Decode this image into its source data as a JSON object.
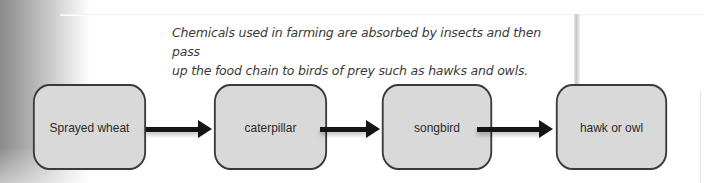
{
  "caption": {
    "line1": "Chemicals used in farming are absorbed by insects and then pass",
    "line2": "up the food chain to birds of prey such as hawks and owls."
  },
  "food_chain": {
    "nodes": [
      {
        "label": "Sprayed wheat"
      },
      {
        "label": "caterpillar"
      },
      {
        "label": "songbird"
      },
      {
        "label": "hawk or owl"
      }
    ],
    "edges": [
      {
        "from": "Sprayed wheat",
        "to": "caterpillar"
      },
      {
        "from": "caterpillar",
        "to": "songbird"
      },
      {
        "from": "songbird",
        "to": "hawk or owl"
      }
    ]
  },
  "colors": {
    "box_fill": "#d9d9d9",
    "box_border": "#3a3a3a",
    "arrow": "#151515",
    "caption_text": "#3a3a3a"
  }
}
